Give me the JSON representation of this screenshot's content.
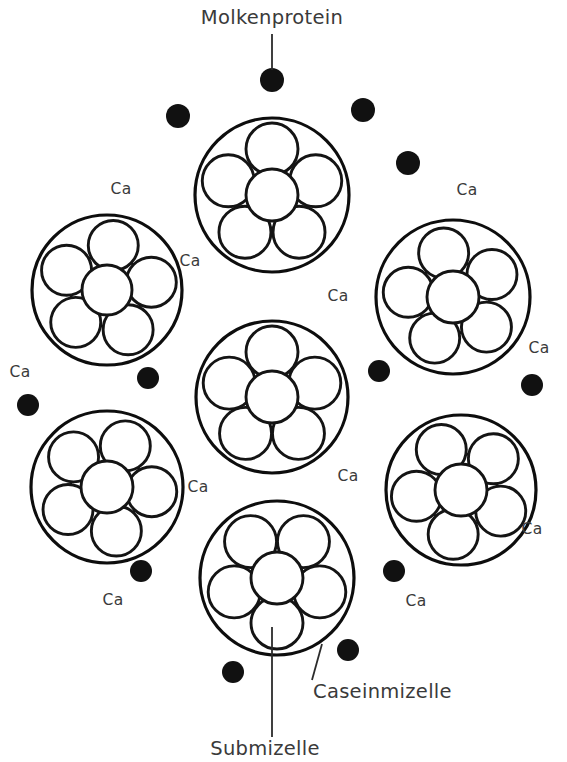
{
  "figure": {
    "title_text": "Molkenprotein",
    "background_color": "#ffffff",
    "ink_color": "#111111",
    "text_color": "#3a3a3a"
  },
  "labels": {
    "molkenprotein": "Molkenprotein",
    "caseinmizelle": "Caseinmizelle",
    "submizelle": "Submizelle",
    "calcium": "Ca"
  },
  "annotations": [
    {
      "id": "molkenprotein",
      "text": "Molkenprotein",
      "x": 272,
      "y": 18,
      "anchor": "middle",
      "size": "big"
    },
    {
      "id": "caseinmizelle",
      "text": "Caseinmizelle",
      "x": 313,
      "y": 692,
      "anchor": "start",
      "size": "big"
    },
    {
      "id": "submizelle",
      "text": "Submizelle",
      "x": 265,
      "y": 749,
      "anchor": "middle",
      "size": "big"
    }
  ],
  "leaders": [
    {
      "id": "molkenprotein-leader",
      "x1": 272,
      "y1": 34,
      "x2": 272,
      "y2": 70
    },
    {
      "id": "caseinmizelle-leader",
      "x1": 322,
      "y1": 644,
      "x2": 312,
      "y2": 680
    },
    {
      "id": "submizelle-leader",
      "x1": 272,
      "y1": 627,
      "x2": 272,
      "y2": 737
    }
  ],
  "calcium_labels": [
    {
      "x": 121,
      "y": 189
    },
    {
      "x": 190,
      "y": 261
    },
    {
      "x": 338,
      "y": 296
    },
    {
      "x": 467,
      "y": 190
    },
    {
      "x": 539,
      "y": 348
    },
    {
      "x": 20,
      "y": 372
    },
    {
      "x": 198,
      "y": 487
    },
    {
      "x": 348,
      "y": 476
    },
    {
      "x": 532,
      "y": 529
    },
    {
      "x": 113,
      "y": 600
    },
    {
      "x": 416,
      "y": 601
    }
  ],
  "whey_protein_dots": [
    {
      "x": 272,
      "y": 80,
      "r": 12
    },
    {
      "x": 178,
      "y": 116,
      "r": 12
    },
    {
      "x": 363,
      "y": 110,
      "r": 12
    },
    {
      "x": 408,
      "y": 163,
      "r": 12
    },
    {
      "x": 148,
      "y": 378,
      "r": 11
    },
    {
      "x": 379,
      "y": 371,
      "r": 11
    },
    {
      "x": 532,
      "y": 385,
      "r": 11
    },
    {
      "x": 28,
      "y": 405,
      "r": 11
    },
    {
      "x": 141,
      "y": 571,
      "r": 11
    },
    {
      "x": 394,
      "y": 571,
      "r": 11
    },
    {
      "x": 348,
      "y": 650,
      "r": 11
    },
    {
      "x": 233,
      "y": 672,
      "r": 11
    }
  ],
  "micelles": [
    {
      "id": "micelle-top-center",
      "cx": 272,
      "cy": 195,
      "r": 77,
      "rotation": 0,
      "sub_outer_r": 26,
      "sub_center_r": 26,
      "ring_radius": 46
    },
    {
      "id": "micelle-left-upper",
      "cx": 107,
      "cy": 290,
      "r": 75,
      "rotation": 8,
      "sub_outer_r": 25,
      "sub_center_r": 25,
      "ring_radius": 45
    },
    {
      "id": "micelle-right-upper",
      "cx": 453,
      "cy": 297,
      "r": 77,
      "rotation": -12,
      "sub_outer_r": 25,
      "sub_center_r": 26,
      "ring_radius": 45
    },
    {
      "id": "micelle-center",
      "cx": 272,
      "cy": 397,
      "r": 76,
      "rotation": 0,
      "sub_outer_r": 26,
      "sub_center_r": 26,
      "ring_radius": 45
    },
    {
      "id": "micelle-left-lower",
      "cx": 107,
      "cy": 487,
      "r": 76,
      "rotation": 24,
      "sub_outer_r": 25,
      "sub_center_r": 26,
      "ring_radius": 45
    },
    {
      "id": "micelle-right-lower",
      "cx": 461,
      "cy": 490,
      "r": 75,
      "rotation": -26,
      "sub_outer_r": 25,
      "sub_center_r": 26,
      "ring_radius": 45
    },
    {
      "id": "micelle-bottom-center",
      "cx": 277,
      "cy": 578,
      "r": 77,
      "rotation": 180,
      "sub_outer_r": 26,
      "sub_center_r": 26,
      "ring_radius": 45
    }
  ],
  "structure_notes": {
    "sub_circles_per_micelle": 6,
    "outer_ring_count": 5,
    "center_count": 1,
    "total_micelles": 7,
    "total_whey_dots": 12,
    "total_ca_labels": 11
  }
}
